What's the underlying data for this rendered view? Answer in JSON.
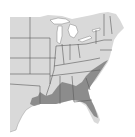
{
  "map": {
    "title": "",
    "region": "Eastern United States",
    "colors": {
      "land": "#d9d9d9",
      "range": "#8c8c8c",
      "borders": "#5a5a5a",
      "water": "#ffffff"
    },
    "legend": []
  }
}
